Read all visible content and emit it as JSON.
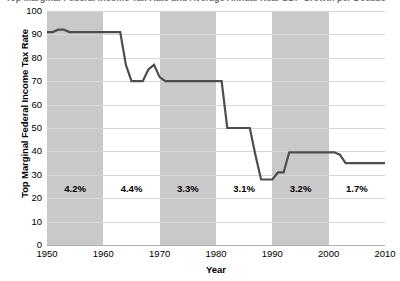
{
  "chart_data": {
    "type": "line",
    "title": "Top Marginal Federal Income Tax Rate and Average Annual Real GDP Growth per Decade",
    "xlabel": "Year",
    "ylabel": "Top Marginal Federal Income Tax Rate",
    "xlim": [
      1950,
      2010
    ],
    "ylim": [
      0,
      100
    ],
    "grid": true,
    "legend": "none",
    "x_ticks": [
      1950,
      1960,
      1970,
      1980,
      1990,
      2000,
      2010
    ],
    "y_ticks": [
      0,
      10,
      20,
      30,
      40,
      50,
      60,
      70,
      80,
      90,
      100
    ],
    "line_color": "#4d4d4d",
    "band_color": "#c9c9c9",
    "gridline_color": "#d6d6d6",
    "series": [
      {
        "name": "Top Marginal Federal Income Tax Rate",
        "x": [
          1950,
          1951,
          1952,
          1953,
          1954,
          1955,
          1963,
          1964,
          1965,
          1967,
          1968,
          1969,
          1970,
          1971,
          1981,
          1982,
          1986,
          1987,
          1988,
          1990,
          1991,
          1992,
          1993,
          2001,
          2002,
          2003,
          2010
        ],
        "values": [
          91,
          91,
          92,
          92,
          91,
          91,
          91,
          77,
          70,
          70,
          75,
          77,
          71.75,
          70,
          70,
          50,
          50,
          38.5,
          28,
          28,
          31,
          31,
          39.6,
          39.6,
          38.6,
          35,
          35
        ]
      }
    ],
    "shaded_bands": [
      {
        "from": 1950,
        "to": 1960
      },
      {
        "from": 1970,
        "to": 1980
      },
      {
        "from": 1990,
        "to": 2000
      }
    ],
    "annotations": [
      {
        "label": "4.2%",
        "decade": "1950s",
        "x": 1955,
        "y": 24
      },
      {
        "label": "4.4%",
        "decade": "1960s",
        "x": 1965,
        "y": 24
      },
      {
        "label": "3.3%",
        "decade": "1970s",
        "x": 1975,
        "y": 24
      },
      {
        "label": "3.1%",
        "decade": "1980s",
        "x": 1985,
        "y": 24
      },
      {
        "label": "3.2%",
        "decade": "1990s",
        "x": 1995,
        "y": 24
      },
      {
        "label": "1.7%",
        "decade": "2000s",
        "x": 2005,
        "y": 24
      }
    ]
  }
}
